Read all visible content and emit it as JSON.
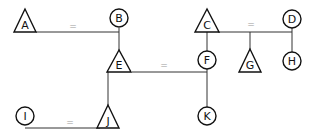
{
  "diagram": {
    "type": "pedigree",
    "nodes": [
      {
        "id": "A",
        "label": "A",
        "shape": "triangle",
        "x": 25,
        "y": 21
      },
      {
        "id": "B",
        "label": "B",
        "shape": "circle",
        "x": 119,
        "y": 19
      },
      {
        "id": "C",
        "label": "C",
        "shape": "triangle",
        "x": 207,
        "y": 21
      },
      {
        "id": "D",
        "label": "D",
        "shape": "circle",
        "x": 292,
        "y": 19
      },
      {
        "id": "E",
        "label": "E",
        "shape": "triangle",
        "x": 119,
        "y": 61
      },
      {
        "id": "F",
        "label": "F",
        "shape": "circle",
        "x": 207,
        "y": 60
      },
      {
        "id": "G",
        "label": "G",
        "shape": "triangle",
        "x": 250,
        "y": 61
      },
      {
        "id": "H",
        "label": "H",
        "shape": "circle",
        "x": 292,
        "y": 61
      },
      {
        "id": "I",
        "label": "I",
        "shape": "circle",
        "x": 25,
        "y": 116
      },
      {
        "id": "J",
        "label": "J",
        "shape": "triangle",
        "x": 108,
        "y": 117
      },
      {
        "id": "K",
        "label": "K",
        "shape": "circle",
        "x": 207,
        "y": 116
      }
    ],
    "unions": [
      {
        "between": [
          "A",
          "B"
        ],
        "symbol": "="
      },
      {
        "between": [
          "C",
          "D"
        ],
        "symbol": "="
      },
      {
        "between": [
          "E",
          "F"
        ],
        "symbol": "="
      },
      {
        "between": [
          "I",
          "J"
        ],
        "symbol": "="
      }
    ],
    "descents": [
      {
        "parents": [
          "A",
          "B"
        ],
        "child": "E"
      },
      {
        "parents": [
          "C",
          "D"
        ],
        "children": [
          "F",
          "G",
          "H"
        ]
      },
      {
        "parents": [
          "E",
          "F"
        ],
        "children": [
          "J",
          "K"
        ]
      }
    ],
    "colors": {
      "stroke": "#111111",
      "equals": "#999999",
      "background": "#ffffff"
    }
  }
}
